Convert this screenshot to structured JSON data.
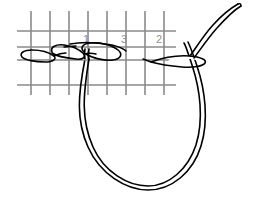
{
  "figure": {
    "background_color": "#ffffff",
    "grid": {
      "line_color": "#8a8a8a",
      "vertical_count": 9,
      "horizontal_count": 4,
      "vertical_x": [
        31,
        50,
        69,
        88,
        107,
        126,
        145,
        164,
        176
      ],
      "vertical_y_top": 11,
      "vertical_y_bottom": 95,
      "horizontal_y": [
        31,
        47,
        60,
        85
      ],
      "horizontal_x_start": 17,
      "horizontal_x_end": 176,
      "labels": [
        {
          "text": "1",
          "x": 86,
          "y": 40
        },
        {
          "text": "3",
          "x": 124,
          "y": 40
        },
        {
          "text": "2",
          "x": 159,
          "y": 40
        }
      ]
    },
    "thread": {
      "color": "#000000",
      "stroke_width": 1.6,
      "elements": [
        "chain-stitch-left",
        "chain-stitch-right",
        "needle",
        "thread-loop",
        "thread-tail"
      ]
    }
  }
}
